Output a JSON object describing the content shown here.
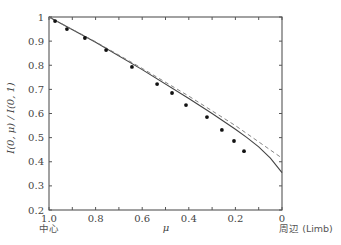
{
  "chart_data": {
    "type": "scatter",
    "title": "",
    "xlabel": "μ",
    "ylabel": "I(0, μ) / I(0, 1)",
    "xlim": [
      1.0,
      0.0
    ],
    "ylim": [
      0.2,
      1.0
    ],
    "x_reversed": true,
    "grid": false,
    "x_ticks": [
      1.0,
      0.8,
      0.6,
      0.4,
      0.2,
      0
    ],
    "x_tick_labels": [
      "1.0",
      "0.8",
      "0.6",
      "0.4",
      "0.2",
      "0"
    ],
    "x_minor_ticks": [
      0.9,
      0.7,
      0.5,
      0.3,
      0.1
    ],
    "y_ticks": [
      0.2,
      0.3,
      0.4,
      0.5,
      0.6,
      0.7,
      0.8,
      0.9,
      1.0
    ],
    "y_tick_labels": [
      "0.2",
      "0.3",
      "0.4",
      "0.5",
      "0.6",
      "0.7",
      "0.8",
      "0.9",
      "1"
    ],
    "annotations": {
      "center_label": "中心",
      "limb_label": "周辺 (Limb)"
    },
    "series": [
      {
        "name": "observed",
        "style": "points",
        "x": [
          0.974,
          0.923,
          0.846,
          0.755,
          0.644,
          0.536,
          0.472,
          0.412,
          0.322,
          0.258,
          0.206,
          0.163
        ],
        "y": [
          0.983,
          0.95,
          0.913,
          0.863,
          0.793,
          0.722,
          0.685,
          0.635,
          0.585,
          0.532,
          0.486,
          0.444
        ]
      },
      {
        "name": "model-solid",
        "style": "solid",
        "x": [
          1.0,
          0.8,
          0.6,
          0.4,
          0.3,
          0.2,
          0.15,
          0.1,
          0.05,
          0.0
        ],
        "y": [
          1.0,
          0.895,
          0.782,
          0.662,
          0.6,
          0.535,
          0.5,
          0.462,
          0.415,
          0.355
        ]
      },
      {
        "name": "model-dashed",
        "style": "dashed",
        "x": [
          1.0,
          0.8,
          0.6,
          0.4,
          0.2,
          0.0
        ],
        "y": [
          1.0,
          0.897,
          0.787,
          0.672,
          0.55,
          0.415
        ]
      }
    ]
  }
}
